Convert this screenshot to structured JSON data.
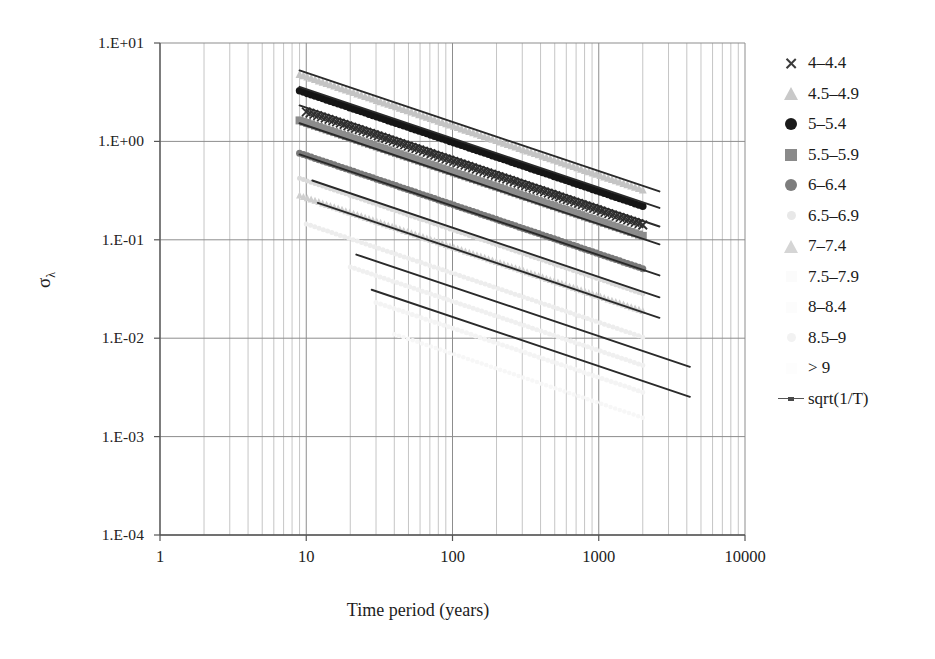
{
  "chart_data": {
    "type": "scatter",
    "title": "",
    "xlabel": "Time period (years)",
    "ylabel": "σλ",
    "ylabel_base": "σ",
    "ylabel_sub": "λ",
    "xscale": "log",
    "yscale": "log",
    "xlim": [
      1,
      10000
    ],
    "ylim": [
      0.0001,
      10
    ],
    "xticks": [
      "1",
      "10",
      "100",
      "1000",
      "10000"
    ],
    "xtick_values": [
      1,
      10,
      100,
      1000,
      10000
    ],
    "yticks": [
      "1.E+01",
      "1.E+00",
      "1.E-01",
      "1.E-02",
      "1.E-03",
      "1.E-04"
    ],
    "ytick_values": [
      10,
      1,
      0.1,
      0.01,
      0.001,
      0.0001
    ],
    "grid": "both-minor-log",
    "legend_position": "right",
    "legend": [
      {
        "label": "4–4.4",
        "marker": "cross",
        "color": "#3a3a3a"
      },
      {
        "label": "4.5–4.9",
        "marker": "triangle",
        "color": "#c9c9c9"
      },
      {
        "label": "5–5.4",
        "marker": "circle",
        "color": "#1a1a1a"
      },
      {
        "label": "5.5–5.9",
        "marker": "square",
        "color": "#8a8a8a"
      },
      {
        "label": "6–6.4",
        "marker": "circle",
        "color": "#7d7d7d"
      },
      {
        "label": "6.5–6.9",
        "marker": "dot",
        "color": "#e8e8e8"
      },
      {
        "label": "7–7.4",
        "marker": "triangle",
        "color": "#d5d5d5"
      },
      {
        "label": "7.5–7.9",
        "marker": "none",
        "color": "#fbfbfb"
      },
      {
        "label": "8–8.4",
        "marker": "none",
        "color": "#fcfcfc"
      },
      {
        "label": "8.5–9",
        "marker": "dot",
        "color": "#f2f2f2"
      },
      {
        "label": "> 9",
        "marker": "none",
        "color": "#fdfdfd"
      },
      {
        "label": "sqrt(1/T)",
        "marker": "line",
        "color": "#555555"
      }
    ],
    "series": [
      {
        "name": "4–4.4",
        "marker": "cross",
        "color": "#2f2f2f",
        "size": 8.5,
        "x_start": 10,
        "x_end": 2000,
        "y_at_10": 2.0,
        "slope": -0.5,
        "n": 90
      },
      {
        "name": "4.5–4.9",
        "marker": "triangle",
        "color": "#c4c4c4",
        "size": 8.0,
        "x_start": 9,
        "x_end": 2000,
        "y_at_10": 4.6,
        "slope": -0.5,
        "n": 90
      },
      {
        "name": "5–5.4",
        "marker": "circle",
        "color": "#151515",
        "size": 7.5,
        "x_start": 9,
        "x_end": 2000,
        "y_at_10": 3.1,
        "slope": -0.5,
        "n": 90
      },
      {
        "name": "5.5–5.9",
        "marker": "square",
        "color": "#8c8c8c",
        "size": 8.0,
        "x_start": 9,
        "x_end": 2000,
        "y_at_10": 1.55,
        "slope": -0.5,
        "n": 90
      },
      {
        "name": "6–6.4",
        "marker": "circle",
        "color": "#7a7a7a",
        "size": 7.0,
        "x_start": 9,
        "x_end": 2000,
        "y_at_10": 0.72,
        "slope": -0.5,
        "n": 90
      },
      {
        "name": "6.5–6.9",
        "marker": "dot",
        "color": "#dadada",
        "size": 5.0,
        "x_start": 9,
        "x_end": 2000,
        "y_at_10": 0.4,
        "slope": -0.5,
        "n": 90
      },
      {
        "name": "7–7.4",
        "marker": "triangle",
        "color": "#cfcfcf",
        "size": 7.0,
        "x_start": 9,
        "x_end": 2000,
        "y_at_10": 0.27,
        "slope": -0.5,
        "n": 90
      },
      {
        "name": "7.5–7.9",
        "marker": "dot",
        "color": "#ededed",
        "size": 5.0,
        "x_start": 10,
        "x_end": 2000,
        "y_at_10": 0.145,
        "slope": -0.5,
        "n": 80
      },
      {
        "name": "8–8.4",
        "marker": "dot",
        "color": "#f0f0f0",
        "size": 5.0,
        "x_start": 20,
        "x_end": 2000,
        "y_at_10": 0.075,
        "slope": -0.5,
        "n": 70
      },
      {
        "name": "8.5–9",
        "marker": "dot",
        "color": "#f4f4f4",
        "size": 5.0,
        "x_start": 30,
        "x_end": 2000,
        "y_at_10": 0.04,
        "slope": -0.5,
        "n": 60
      },
      {
        "name": "> 9",
        "marker": "dot",
        "color": "#f7f7f7",
        "size": 4.5,
        "x_start": 40,
        "x_end": 2000,
        "y_at_10": 0.022,
        "slope": -0.5,
        "n": 55
      }
    ],
    "trend_lines": [
      {
        "for": "4.5–4.9",
        "y_at_10": 5.0,
        "slope": -0.5,
        "x_start": 9,
        "x_end": 2600
      },
      {
        "for": "4–4.4",
        "y_at_10": 3.4,
        "slope": -0.5,
        "x_start": 9,
        "x_end": 2600
      },
      {
        "for": "5–5.4",
        "y_at_10": 2.2,
        "slope": -0.5,
        "x_start": 9,
        "x_end": 2600
      },
      {
        "for": "5.5–5.9",
        "y_at_10": 1.45,
        "slope": -0.5,
        "x_start": 9,
        "x_end": 2600
      },
      {
        "for": "6–6.4",
        "y_at_10": 0.7,
        "slope": -0.5,
        "x_start": 9,
        "x_end": 2600
      },
      {
        "for": "6.5–6.9",
        "y_at_10": 0.42,
        "slope": -0.5,
        "x_start": 11,
        "x_end": 2600
      },
      {
        "for": "7–7.4",
        "y_at_10": 0.26,
        "slope": -0.5,
        "x_start": 12,
        "x_end": 2600
      },
      {
        "for": "7.5–7.9",
        "y_at_10": 0.105,
        "slope": -0.5,
        "x_start": 22,
        "x_end": 4200
      },
      {
        "for": "8–8.4",
        "y_at_10": 0.052,
        "slope": -0.5,
        "x_start": 28,
        "x_end": 4200
      }
    ]
  }
}
